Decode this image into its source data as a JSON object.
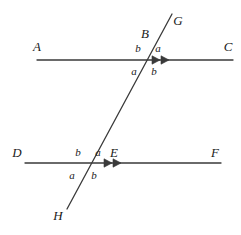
{
  "figure": {
    "stroke_color": "#3a3a3a",
    "text_color": "#1a1a1a",
    "background": "#ffffff",
    "width": 241,
    "height": 235
  },
  "lines": {
    "upper_parallel": {
      "name": "line-AC",
      "start_label": "A",
      "end_label": "C",
      "x1": 37,
      "y1": 60,
      "x2": 233,
      "y2": 60,
      "arrow_marks": 2
    },
    "lower_parallel": {
      "name": "line-DF",
      "start_label": "D",
      "end_label": "F",
      "x1": 25,
      "y1": 163,
      "x2": 221,
      "y2": 163,
      "arrow_marks": 2
    },
    "transversal": {
      "name": "line-GH",
      "top_label": "G",
      "bottom_label": "H",
      "x1": 172,
      "y1": 14,
      "x2": 67,
      "y2": 209
    }
  },
  "points": [
    {
      "id": "A",
      "label": "A",
      "x": 37,
      "y": 46
    },
    {
      "id": "C",
      "label": "C",
      "x": 228,
      "y": 46
    },
    {
      "id": "B",
      "label": "B",
      "x": 145,
      "y": 33
    },
    {
      "id": "G",
      "label": "G",
      "x": 178,
      "y": 20
    },
    {
      "id": "D",
      "label": "D",
      "x": 17,
      "y": 152
    },
    {
      "id": "F",
      "label": "F",
      "x": 215,
      "y": 152
    },
    {
      "id": "E",
      "label": "E",
      "x": 114,
      "y": 152
    },
    {
      "id": "H",
      "label": "H",
      "x": 58,
      "y": 215
    }
  ],
  "angles": {
    "upper_intersection": {
      "vertex_x": 148,
      "vertex_y": 60,
      "labels": [
        {
          "id": "upper-top-left",
          "label": "b",
          "x": 138,
          "y": 48
        },
        {
          "id": "upper-top-right",
          "label": "a",
          "x": 158,
          "y": 48
        },
        {
          "id": "upper-bottom-left",
          "label": "a",
          "x": 134,
          "y": 71
        },
        {
          "id": "upper-bottom-right",
          "label": "b",
          "x": 154,
          "y": 71
        }
      ]
    },
    "lower_intersection": {
      "vertex_x": 88,
      "vertex_y": 163,
      "labels": [
        {
          "id": "lower-top-left",
          "label": "b",
          "x": 78,
          "y": 152
        },
        {
          "id": "lower-top-right",
          "label": "a",
          "x": 98,
          "y": 152
        },
        {
          "id": "lower-bottom-left",
          "label": "a",
          "x": 72,
          "y": 175
        },
        {
          "id": "lower-bottom-right",
          "label": "b",
          "x": 94,
          "y": 175
        }
      ]
    }
  },
  "arrow_marks": [
    {
      "id": "upper-arrow-1",
      "x": 160,
      "y": 60
    },
    {
      "id": "upper-arrow-2",
      "x": 169,
      "y": 60
    },
    {
      "id": "lower-arrow-1",
      "x": 112,
      "y": 163
    },
    {
      "id": "lower-arrow-2",
      "x": 121,
      "y": 163
    }
  ]
}
